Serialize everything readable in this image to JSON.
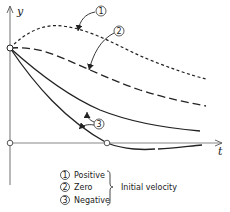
{
  "diagram": {
    "axes": {
      "y_label": "y",
      "x_label": "t"
    },
    "curves": [
      {
        "id": "1",
        "label": "Positive",
        "style": "dotted",
        "description": "rises to a maximum then decays toward zero"
      },
      {
        "id": "2",
        "label": "Zero",
        "style": "dashed",
        "description": "starts flat then decays toward zero"
      },
      {
        "id": "3",
        "label": "Negative",
        "style": "solid",
        "description": "decays immediately; one curve overshoots below the axis"
      }
    ],
    "callouts": [
      "1",
      "2",
      "3"
    ],
    "legend": {
      "items": [
        {
          "marker": "1",
          "text": "Positive"
        },
        {
          "marker": "2",
          "text": "Zero"
        },
        {
          "marker": "3",
          "text": "Negative"
        }
      ],
      "group_label": "Initial velocity"
    },
    "colors": {
      "ink": "#222222",
      "axis": "#777777",
      "background": "#ffffff"
    }
  }
}
